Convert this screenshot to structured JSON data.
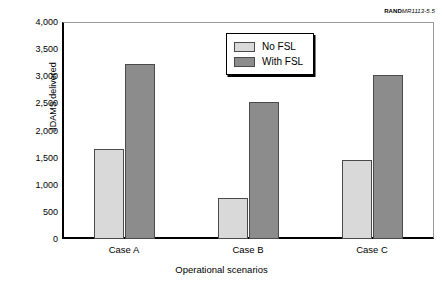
{
  "credit": {
    "mark": "RAND",
    "document": "MR1113-5.5"
  },
  "chart_data": {
    "type": "bar",
    "title": "",
    "xlabel": "Operational scenarios",
    "ylabel": "JDAMS delivered",
    "categories": [
      "Case A",
      "Case B",
      "Case C"
    ],
    "series": [
      {
        "name": "No FSL",
        "color": "#d9d9d9",
        "values": [
          1660,
          760,
          1450
        ]
      },
      {
        "name": "With FSL",
        "color": "#8c8c8c",
        "values": [
          3230,
          2520,
          3020
        ]
      }
    ],
    "ylim": [
      0,
      4000
    ],
    "yticks": [
      0,
      500,
      1000,
      1500,
      2000,
      2500,
      3000,
      3500,
      4000
    ],
    "ytick_labels": [
      "0",
      "500",
      "1,000",
      "1,500",
      "2,000",
      "2,500",
      "3,000",
      "3,500",
      "4,000"
    ],
    "grid": false,
    "legend_position": "upper-center"
  }
}
